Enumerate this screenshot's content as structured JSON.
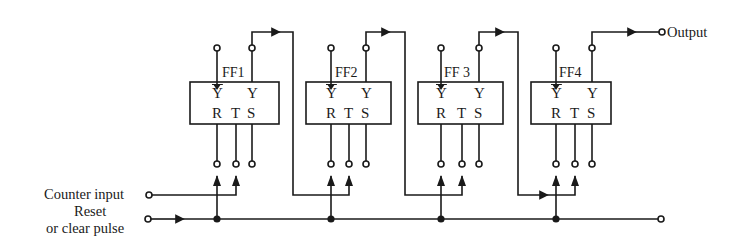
{
  "diagram": {
    "type": "4-bit ripple counter (flip-flop chain)",
    "colors": {
      "line": "#1a1a1a",
      "background": "#ffffff"
    },
    "inputs": {
      "counter_input": "Counter input",
      "reset_line1": "Reset",
      "reset_line2": "or clear pulse"
    },
    "output": "Output",
    "flip_flops": [
      {
        "name": "FF1",
        "pins_top": [
          "Y̅",
          "Y"
        ],
        "pins_bottom": [
          "R",
          "T",
          "S"
        ],
        "ybar": "Y",
        "y": "Y",
        "r": "R",
        "t": "T",
        "s": "S"
      },
      {
        "name": "FF2",
        "pins_top": [
          "Y̅",
          "Y"
        ],
        "pins_bottom": [
          "R",
          "T",
          "S"
        ],
        "ybar": "Y",
        "y": "Y",
        "r": "R",
        "t": "T",
        "s": "S"
      },
      {
        "name": "FF 3",
        "pins_top": [
          "Y̅",
          "Y"
        ],
        "pins_bottom": [
          "R",
          "T",
          "S"
        ],
        "ybar": "Y",
        "y": "Y",
        "r": "R",
        "t": "T",
        "s": "S"
      },
      {
        "name": "FF4",
        "pins_top": [
          "Y̅",
          "Y"
        ],
        "pins_bottom": [
          "R",
          "T",
          "S"
        ],
        "ybar": "Y",
        "y": "Y",
        "r": "R",
        "t": "T",
        "s": "S"
      }
    ],
    "connections": [
      "Counter input -> FF1.T",
      "FF1.Y -> FF2.T",
      "FF2.Y -> FF3.T",
      "FF3.Y -> FF4.T",
      "FF4.Y -> Output",
      "Reset/clear pulse -> FF1.R, FF2.R, FF3.R, FF4.R"
    ]
  }
}
